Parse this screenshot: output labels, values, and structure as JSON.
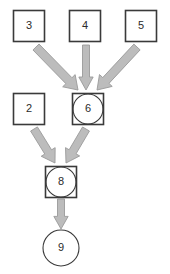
{
  "diagram": {
    "type": "directed-graph",
    "title": "",
    "canvas": {
      "width": 170,
      "height": 274,
      "background": "#ffffff"
    },
    "style": {
      "node_stroke": "#3a3a3a",
      "node_fill": "#ffffff",
      "node_stroke_width": 1.6,
      "inner_circle_stroke": "#3a3a3a",
      "arrow_fill": "#bcbcbc",
      "arrow_stroke": "#9a9a9a",
      "label_color": "#2b2b2b"
    },
    "nodes": [
      {
        "id": "n3",
        "label": "3",
        "shape": "square",
        "cx": 29,
        "cy": 26,
        "size": 31,
        "radius": 0
      },
      {
        "id": "n4",
        "label": "4",
        "shape": "square",
        "cx": 85,
        "cy": 26,
        "size": 31,
        "radius": 0
      },
      {
        "id": "n5",
        "label": "5",
        "shape": "square",
        "cx": 141,
        "cy": 26,
        "size": 31,
        "radius": 0
      },
      {
        "id": "n2",
        "label": "2",
        "shape": "square",
        "cx": 29,
        "cy": 109,
        "size": 31,
        "radius": 0
      },
      {
        "id": "n6",
        "label": "6",
        "shape": "square-in-circle",
        "cx": 88,
        "cy": 109,
        "size": 31,
        "radius": 15
      },
      {
        "id": "n8",
        "label": "8",
        "shape": "square-in-circle",
        "cx": 61,
        "cy": 182,
        "size": 31,
        "radius": 15
      },
      {
        "id": "n9",
        "label": "9",
        "shape": "circle",
        "cx": 61,
        "cy": 248,
        "size": 0,
        "radius": 18
      }
    ],
    "edges": [
      {
        "id": "e3-6",
        "from": "n3",
        "to": "n6",
        "label": "",
        "x1": 36,
        "y1": 47,
        "x2": 78,
        "y2": 90,
        "width": 8.5
      },
      {
        "id": "e4-6",
        "from": "n4",
        "to": "n6",
        "label": "",
        "x1": 86,
        "y1": 45,
        "x2": 86,
        "y2": 90,
        "width": 7.0
      },
      {
        "id": "e5-6",
        "from": "n5",
        "to": "n6",
        "label": "",
        "x1": 137,
        "y1": 47,
        "x2": 97,
        "y2": 90,
        "width": 8.5
      },
      {
        "id": "e2-8",
        "from": "n2",
        "to": "n8",
        "label": "",
        "x1": 34,
        "y1": 129,
        "x2": 55,
        "y2": 163,
        "width": 8.0
      },
      {
        "id": "e6-8",
        "from": "n6",
        "to": "n8",
        "label": "",
        "x1": 86,
        "y1": 129,
        "x2": 66,
        "y2": 163,
        "width": 8.0
      },
      {
        "id": "e8-9",
        "from": "n8",
        "to": "n9",
        "label": "",
        "x1": 61,
        "y1": 199,
        "x2": 61,
        "y2": 229,
        "width": 7.0
      }
    ]
  }
}
